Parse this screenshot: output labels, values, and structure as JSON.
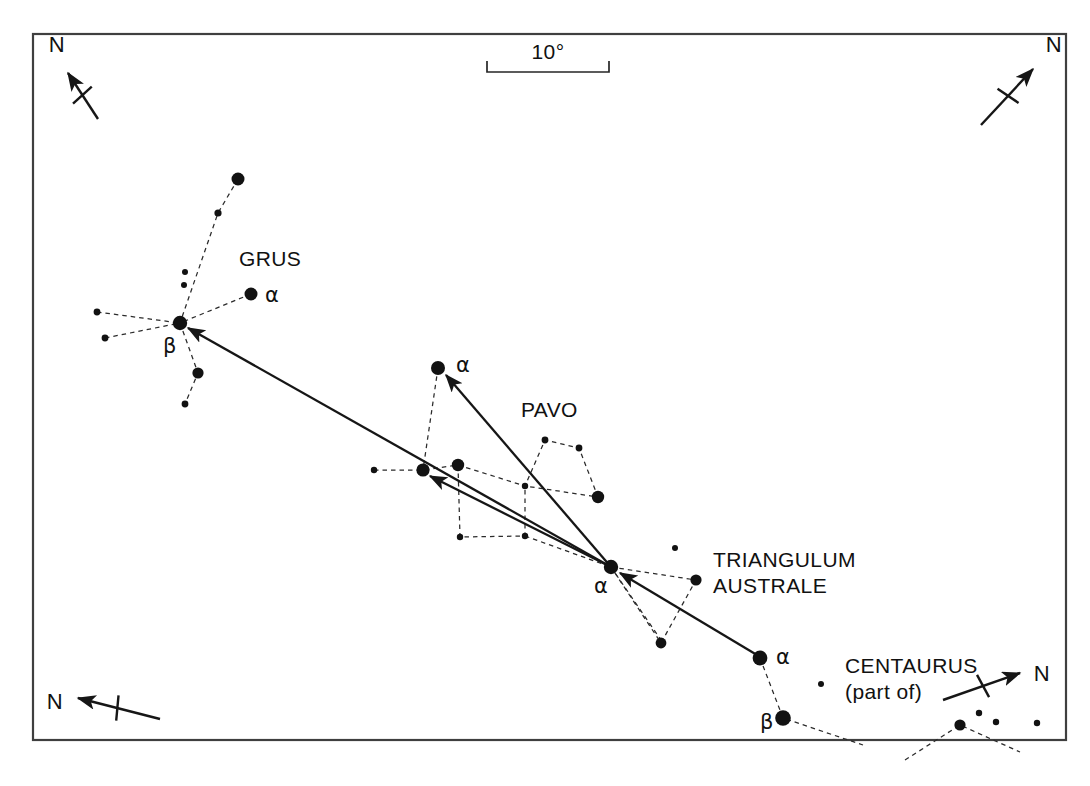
{
  "figure": {
    "type": "star-chart",
    "frame": {
      "x": 33,
      "y": 34,
      "width": 1033,
      "height": 706
    },
    "canvas": {
      "width": 1090,
      "height": 786
    },
    "background_color": "#ffffff",
    "ink_color": "#121212",
    "frame_color": "#3f3f3f"
  },
  "scale_bar": {
    "label": "10°",
    "x1": 487,
    "x2": 609,
    "y": 72,
    "tick_height": 11,
    "label_x": 548,
    "label_y": 59
  },
  "compasses": [
    {
      "name": "compass-top-left",
      "label": "N",
      "tail_x": 98,
      "tail_y": 119,
      "head_x": 68,
      "head_y": 73,
      "tick_len": 25,
      "label_x": 57,
      "label_y": 52
    },
    {
      "name": "compass-top-right",
      "label": "N",
      "tail_x": 981,
      "tail_y": 125,
      "head_x": 1033,
      "head_y": 69,
      "tick_len": 25,
      "label_x": 1054,
      "label_y": 52
    },
    {
      "name": "compass-bottom-left",
      "label": "N",
      "tail_x": 160,
      "tail_y": 719,
      "head_x": 78,
      "head_y": 698,
      "tick_len": 25,
      "label_x": 55,
      "label_y": 709
    },
    {
      "name": "compass-bottom-right",
      "label": "N",
      "tail_x": 943,
      "tail_y": 700,
      "head_x": 1020,
      "head_y": 673,
      "tick_len": 25,
      "label_x": 1042,
      "label_y": 681
    }
  ],
  "constellation_labels": [
    {
      "name": "label-grus",
      "text": "GRUS",
      "x": 239,
      "y": 266,
      "size": 21
    },
    {
      "name": "label-pavo",
      "text": "PAVO",
      "x": 521,
      "y": 417,
      "size": 21
    },
    {
      "name": "label-triangulum",
      "text": "TRIANGULUM",
      "x": 713,
      "y": 567,
      "size": 21
    },
    {
      "name": "label-australe",
      "text": "AUSTRALE",
      "x": 713,
      "y": 593,
      "size": 21
    },
    {
      "name": "label-centaurus",
      "text": "CENTAURUS",
      "x": 845,
      "y": 673,
      "size": 21
    },
    {
      "name": "label-centaurus-part-of",
      "text": "(part of)",
      "x": 845,
      "y": 699,
      "size": 20
    }
  ],
  "star_labels": [
    {
      "name": "label-alpha-grus",
      "text": "α",
      "x": 265,
      "y": 302
    },
    {
      "name": "label-beta-grus",
      "text": "β",
      "x": 163,
      "y": 353
    },
    {
      "name": "label-alpha-pavo",
      "text": "α",
      "x": 456,
      "y": 372
    },
    {
      "name": "label-alpha-triangulum",
      "text": "α",
      "x": 594,
      "y": 593
    },
    {
      "name": "label-alpha-centaurus",
      "text": "α",
      "x": 776,
      "y": 664
    },
    {
      "name": "label-beta-centaurus",
      "text": "β",
      "x": 760,
      "y": 729
    }
  ],
  "chart_data": {
    "type": "scatter",
    "scale_label": "10°",
    "stars": [
      {
        "id": "gru-top",
        "constellation": "Grus",
        "x": 238,
        "y": 179,
        "r": 6.5
      },
      {
        "id": "gru-chain1",
        "constellation": "Grus",
        "x": 218,
        "y": 213,
        "r": 3.6
      },
      {
        "id": "gru-tiny1",
        "constellation": "Grus",
        "x": 185,
        "y": 272,
        "r": 3.0
      },
      {
        "id": "gru-tiny2",
        "constellation": "Grus",
        "x": 184,
        "y": 285,
        "r": 3.0
      },
      {
        "id": "gru-alpha",
        "constellation": "Grus",
        "x": 251,
        "y": 294,
        "r": 6.5,
        "bayer": "alpha"
      },
      {
        "id": "gru-west1",
        "constellation": "Grus",
        "x": 97,
        "y": 312,
        "r": 3.4
      },
      {
        "id": "gru-beta",
        "constellation": "Grus",
        "x": 180,
        "y": 323,
        "r": 7.2,
        "bayer": "beta"
      },
      {
        "id": "gru-west2",
        "constellation": "Grus",
        "x": 105,
        "y": 338,
        "r": 3.4
      },
      {
        "id": "gru-south1",
        "constellation": "Grus",
        "x": 198,
        "y": 373,
        "r": 5.6
      },
      {
        "id": "gru-south2",
        "constellation": "Grus",
        "x": 185,
        "y": 404,
        "r": 3.4
      },
      {
        "id": "pav-alpha",
        "constellation": "Pavo",
        "x": 438,
        "y": 368,
        "r": 7.0,
        "bayer": "alpha"
      },
      {
        "id": "pav-w1",
        "constellation": "Pavo",
        "x": 374,
        "y": 470,
        "r": 3.2
      },
      {
        "id": "pav-hub",
        "constellation": "Pavo",
        "x": 423,
        "y": 470,
        "r": 6.6
      },
      {
        "id": "pav-hub2",
        "constellation": "Pavo",
        "x": 458,
        "y": 465,
        "r": 6.2
      },
      {
        "id": "pav-q1",
        "constellation": "Pavo",
        "x": 545,
        "y": 440,
        "r": 3.4
      },
      {
        "id": "pav-q2",
        "constellation": "Pavo",
        "x": 579,
        "y": 448,
        "r": 3.4
      },
      {
        "id": "pav-cross",
        "constellation": "Pavo",
        "x": 525,
        "y": 486,
        "r": 3.2
      },
      {
        "id": "pav-q3",
        "constellation": "Pavo",
        "x": 598,
        "y": 497,
        "r": 6.2
      },
      {
        "id": "pav-s1",
        "constellation": "Pavo",
        "x": 460,
        "y": 537,
        "r": 3.2
      },
      {
        "id": "pav-s2",
        "constellation": "Pavo",
        "x": 525,
        "y": 536,
        "r": 3.2
      },
      {
        "id": "tra-small",
        "constellation": "Triangulum Australe",
        "x": 675,
        "y": 548,
        "r": 3.0
      },
      {
        "id": "tra-alpha",
        "constellation": "Triangulum Australe",
        "x": 611,
        "y": 567,
        "r": 7.2,
        "bayer": "alpha"
      },
      {
        "id": "tra-b",
        "constellation": "Triangulum Australe",
        "x": 696,
        "y": 580,
        "r": 5.6
      },
      {
        "id": "tra-c",
        "constellation": "Triangulum Australe",
        "x": 661,
        "y": 643,
        "r": 5.4
      },
      {
        "id": "cen-alpha",
        "constellation": "Centaurus",
        "x": 760,
        "y": 658,
        "r": 7.4,
        "bayer": "alpha"
      },
      {
        "id": "cen-small1",
        "constellation": "Centaurus",
        "x": 821,
        "y": 684,
        "r": 3.0
      },
      {
        "id": "cen-beta",
        "constellation": "Centaurus",
        "x": 783,
        "y": 718,
        "r": 7.8,
        "bayer": "beta"
      },
      {
        "id": "cen-e1",
        "constellation": "Centaurus",
        "x": 960,
        "y": 725,
        "r": 5.6
      },
      {
        "id": "cen-e2",
        "constellation": "Centaurus",
        "x": 979,
        "y": 713,
        "r": 3.2
      },
      {
        "id": "cen-e3",
        "constellation": "Centaurus",
        "x": 996,
        "y": 722,
        "r": 3.2
      },
      {
        "id": "cen-e4",
        "constellation": "Centaurus",
        "x": 1037,
        "y": 723,
        "r": 3.2
      }
    ],
    "constellation_lines": [
      {
        "constellation": "Grus",
        "points": [
          [
            238,
            179
          ],
          [
            218,
            213
          ],
          [
            180,
            323
          ]
        ]
      },
      {
        "constellation": "Grus",
        "points": [
          [
            97,
            312
          ],
          [
            180,
            323
          ]
        ]
      },
      {
        "constellation": "Grus",
        "points": [
          [
            105,
            338
          ],
          [
            180,
            323
          ]
        ]
      },
      {
        "constellation": "Grus",
        "points": [
          [
            251,
            294
          ],
          [
            180,
            323
          ]
        ]
      },
      {
        "constellation": "Grus",
        "points": [
          [
            180,
            323
          ],
          [
            198,
            373
          ],
          [
            185,
            404
          ]
        ]
      },
      {
        "constellation": "Pavo",
        "points": [
          [
            438,
            368
          ],
          [
            423,
            470
          ]
        ]
      },
      {
        "constellation": "Pavo",
        "points": [
          [
            374,
            470
          ],
          [
            423,
            470
          ],
          [
            458,
            465
          ]
        ]
      },
      {
        "constellation": "Pavo",
        "points": [
          [
            458,
            465
          ],
          [
            525,
            486
          ],
          [
            545,
            440
          ],
          [
            579,
            448
          ],
          [
            598,
            497
          ],
          [
            525,
            486
          ]
        ]
      },
      {
        "constellation": "Pavo",
        "points": [
          [
            458,
            465
          ],
          [
            460,
            537
          ],
          [
            525,
            536
          ],
          [
            525,
            486
          ]
        ]
      },
      {
        "constellation": "Pavo",
        "points": [
          [
            525,
            536
          ],
          [
            611,
            567
          ]
        ]
      },
      {
        "constellation": "Triangulum Australe",
        "points": [
          [
            611,
            567
          ],
          [
            696,
            580
          ],
          [
            661,
            643
          ],
          [
            611,
            567
          ]
        ]
      },
      {
        "constellation": "Centaurus",
        "points": [
          [
            760,
            658
          ],
          [
            783,
            718
          ],
          [
            863,
            745
          ]
        ]
      },
      {
        "constellation": "Centaurus",
        "points": [
          [
            905,
            760
          ],
          [
            960,
            725
          ],
          [
            1020,
            752
          ]
        ]
      },
      {
        "constellation": "Centaurus",
        "points": [
          [
            611,
            567
          ],
          [
            663,
            643
          ]
        ]
      }
    ],
    "pointer_vectors": [
      {
        "name": "vector-tra-to-grus-beta",
        "from": [
          611,
          567
        ],
        "to": [
          188,
          328
        ],
        "from_star": "tra-alpha",
        "to_star": "gru-beta"
      },
      {
        "name": "vector-tra-to-pav-alpha",
        "from": [
          611,
          567
        ],
        "to": [
          446,
          375
        ],
        "from_star": "tra-alpha",
        "to_star": "pav-alpha"
      },
      {
        "name": "vector-tra-to-pav-hub",
        "from": [
          611,
          567
        ],
        "to": [
          430,
          476
        ],
        "from_star": "tra-alpha",
        "to_star": "pav-hub"
      },
      {
        "name": "vector-cen-to-tra-alpha",
        "from": [
          757,
          655
        ],
        "to": [
          620,
          573
        ],
        "from_star": "cen-alpha",
        "to_star": "tra-alpha"
      }
    ]
  }
}
